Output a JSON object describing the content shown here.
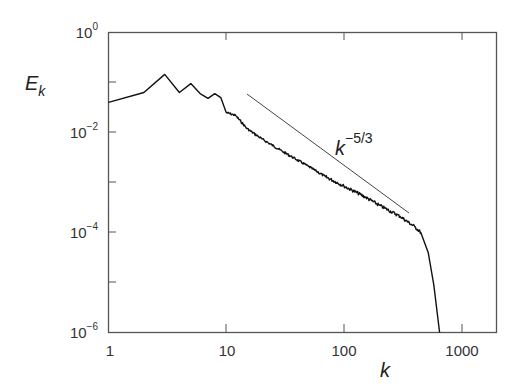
{
  "chart_data": {
    "type": "line",
    "title": "",
    "xlabel": "k",
    "ylabel": "E_k",
    "xscale": "log",
    "yscale": "log",
    "xlim": [
      1,
      2000
    ],
    "ylim": [
      1e-06,
      1
    ],
    "grid": false,
    "legend": null,
    "x_ticks": [
      "1",
      "10",
      "100",
      "1000"
    ],
    "y_ticks": [
      {
        "base": "10",
        "exp": "0"
      },
      {
        "base": "10",
        "exp": "−2"
      },
      {
        "base": "10",
        "exp": "−4"
      },
      {
        "base": "10",
        "exp": "−6"
      }
    ],
    "series": [
      {
        "name": "Energy spectrum",
        "x": [
          1,
          2,
          3,
          4,
          5,
          6,
          7,
          8,
          9,
          10,
          12,
          15,
          20,
          30,
          50,
          70,
          100,
          150,
          200,
          300,
          400,
          450,
          520,
          580,
          650
        ],
        "y": [
          0.04,
          0.063,
          0.145,
          0.063,
          0.095,
          0.06,
          0.048,
          0.06,
          0.05,
          0.025,
          0.022,
          0.012,
          0.0075,
          0.0042,
          0.0021,
          0.0013,
          0.00085,
          0.00052,
          0.00035,
          0.00021,
          0.00013,
          0.0001,
          4e-05,
          9e-06,
          1e-06
        ]
      },
      {
        "name": "k^-5/3 reference",
        "x": [
          15,
          350
        ],
        "y": [
          0.063,
          0.0003
        ]
      }
    ],
    "annotations": [
      {
        "text": "k",
        "superscript": "−5/3",
        "x": 210,
        "y": 0.004
      }
    ]
  },
  "labels": {
    "xlabel": "k",
    "ylabel_main": "E",
    "ylabel_sub": "k",
    "annotation_base": "k",
    "annotation_exp": "−5/3",
    "x_ticks": [
      "1",
      "10",
      "100",
      "1000"
    ],
    "y_ticks": [
      {
        "base": "10",
        "exp": "0"
      },
      {
        "base": "10",
        "exp": "−2"
      },
      {
        "base": "10",
        "exp": "−4"
      },
      {
        "base": "10",
        "exp": "−6"
      }
    ]
  }
}
